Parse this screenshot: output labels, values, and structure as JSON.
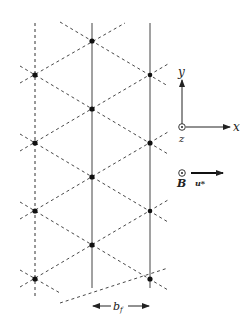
{
  "diagram": {
    "lattice": {
      "columns": [
        {
          "x": 35,
          "style": "dashed",
          "nodes_y": [
            75,
            143,
            211,
            279
          ],
          "y_range": [
            23,
            295
          ]
        },
        {
          "x": 92,
          "style": "solid",
          "nodes_y": [
            41,
            109,
            177,
            245
          ],
          "y_range": [
            23,
            288
          ]
        },
        {
          "x": 150,
          "style": "solid",
          "nodes_y": [
            75,
            143,
            211,
            279
          ],
          "y_range": [
            23,
            288
          ]
        }
      ],
      "row_spacing": 68
    },
    "axes": {
      "x_label": "x",
      "y_label": "y",
      "z_label": "z",
      "origin_symbol": "dot-in-circle"
    },
    "field": {
      "B_label": "B",
      "B_symbol": "dot-in-circle",
      "velocity_label": "u*"
    },
    "spacing": {
      "label": "b",
      "subscript": "f"
    },
    "colors": {
      "line": "#333333",
      "node": "#111111",
      "background": "#ffffff"
    }
  }
}
